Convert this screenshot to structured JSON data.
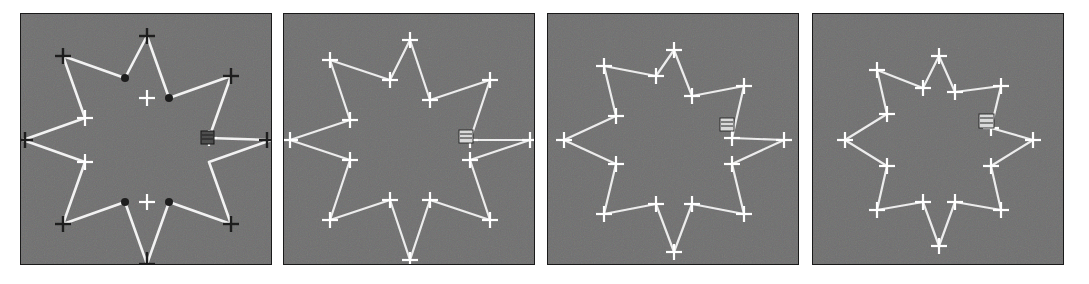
{
  "figure": {
    "panel_count": 4,
    "background_color": "#6f6f6f",
    "contour_color": "#f2f2f2",
    "marker_color": "#ffffff",
    "dark_marker_color": "#1c1c1c",
    "page_background": "#ffffff",
    "border_color": "#1a1a1a"
  },
  "panels": [
    {
      "id": "panel-1",
      "label": "",
      "iteration": "1",
      "marker_style": "mixed-dark-cross",
      "shape": "8-point-star",
      "outer_radius": 104,
      "inner_radius": 42,
      "point_count": 8,
      "handle": {
        "x": 176,
        "y": 123,
        "kind": "selection-box"
      },
      "inner_markers": "dark-dots",
      "outer_markers": "dark-crosses",
      "left_markers": "white-crosses"
    },
    {
      "id": "panel-2",
      "label": "",
      "iteration": "2",
      "marker_style": "white-cross",
      "shape": "8-point-star",
      "outer_radius": 100,
      "inner_radius": 46,
      "point_count": 8,
      "handle": {
        "x": 180,
        "y": 122,
        "kind": "selection-box"
      },
      "inner_markers": "white-crosses",
      "outer_markers": "white-crosses",
      "left_markers": "white-crosses"
    },
    {
      "id": "panel-3",
      "label": "",
      "iteration": "3",
      "marker_style": "white-cross-doubled",
      "shape": "8-point-star-contracted",
      "outer_radius": 90,
      "inner_radius": 62,
      "point_count": 8,
      "handle": {
        "x": 181,
        "y": 113,
        "kind": "selection-box"
      },
      "inner_markers": "white-crosses",
      "outer_markers": "white-crosses",
      "left_markers": "white-crosses"
    },
    {
      "id": "panel-4",
      "label": "",
      "iteration": "4",
      "marker_style": "white-cross-doubled",
      "shape": "near-circle",
      "outer_radius": 84,
      "inner_radius": 74,
      "point_count": 8,
      "handle": {
        "x": 183,
        "y": 110,
        "kind": "selection-box"
      },
      "inner_markers": "white-crosses",
      "outer_markers": "white-crosses",
      "left_markers": "white-crosses"
    }
  ],
  "chart_data": {
    "type": "line",
    "xlabel": "",
    "ylabel": "",
    "grid": false,
    "legend_position": "none",
    "series": [
      {
        "name": "panel-1 contour (iteration 1)",
        "closed": true,
        "point_count": 16,
        "outer_radius": 104,
        "inner_radius": 42,
        "points": [
          [
            126,
            22
          ],
          [
            148,
            84
          ],
          [
            210,
            62
          ],
          [
            188,
            124
          ],
          [
            250,
            126
          ],
          [
            188,
            148
          ],
          [
            210,
            210
          ],
          [
            148,
            188
          ],
          [
            126,
            250
          ],
          [
            104,
            188
          ],
          [
            42,
            210
          ],
          [
            64,
            148
          ],
          [
            2,
            126
          ],
          [
            64,
            104
          ],
          [
            42,
            42
          ],
          [
            104,
            64
          ]
        ]
      },
      {
        "name": "panel-2 contour (iteration 2)",
        "closed": true,
        "point_count": 16,
        "outer_radius": 100,
        "inner_radius": 46,
        "points": [
          [
            126,
            26
          ],
          [
            146,
            86
          ],
          [
            206,
            66
          ],
          [
            186,
            126
          ],
          [
            246,
            126
          ],
          [
            186,
            146
          ],
          [
            206,
            206
          ],
          [
            146,
            186
          ],
          [
            126,
            246
          ],
          [
            106,
            186
          ],
          [
            46,
            206
          ],
          [
            66,
            146
          ],
          [
            6,
            126
          ],
          [
            66,
            106
          ],
          [
            46,
            46
          ],
          [
            106,
            66
          ]
        ]
      },
      {
        "name": "panel-3 contour (iteration 3)",
        "closed": true,
        "point_count": 16,
        "outer_radius": 90,
        "inner_radius": 62,
        "points": [
          [
            126,
            36
          ],
          [
            144,
            82
          ],
          [
            196,
            72
          ],
          [
            184,
            124
          ],
          [
            236,
            126
          ],
          [
            184,
            150
          ],
          [
            196,
            200
          ],
          [
            144,
            190
          ],
          [
            126,
            238
          ],
          [
            108,
            190
          ],
          [
            56,
            200
          ],
          [
            68,
            150
          ],
          [
            16,
            126
          ],
          [
            68,
            102
          ],
          [
            56,
            52
          ],
          [
            108,
            62
          ]
        ]
      },
      {
        "name": "panel-4 contour (iteration 4)",
        "closed": true,
        "point_count": 16,
        "outer_radius": 84,
        "inner_radius": 74,
        "points": [
          [
            126,
            42
          ],
          [
            142,
            78
          ],
          [
            188,
            72
          ],
          [
            178,
            114
          ],
          [
            220,
            126
          ],
          [
            178,
            152
          ],
          [
            188,
            196
          ],
          [
            142,
            188
          ],
          [
            126,
            232
          ],
          [
            110,
            188
          ],
          [
            64,
            196
          ],
          [
            74,
            152
          ],
          [
            32,
            126
          ],
          [
            74,
            100
          ],
          [
            64,
            56
          ],
          [
            110,
            74
          ]
        ]
      }
    ]
  }
}
